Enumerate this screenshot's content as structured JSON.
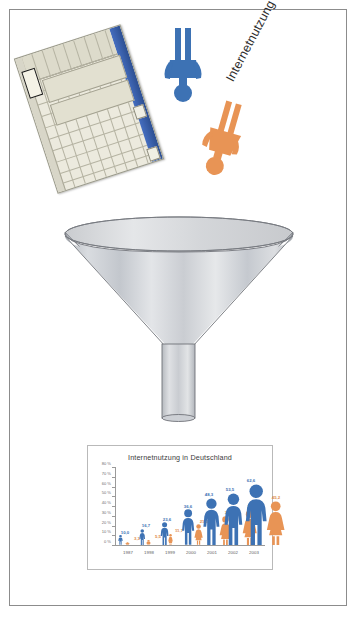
{
  "caption": "Internetnutzung",
  "icons": {
    "spreadsheet": "spreadsheet-window-icon",
    "male_figure": "male-pictogram-icon",
    "female_figure": "female-pictogram-icon",
    "funnel": "funnel-icon"
  },
  "colors": {
    "male_blue": "#3d72b4",
    "female_orange": "#e89455",
    "funnel_metal": "#c8cbd0",
    "frame_border": "#8c8c8c"
  },
  "chart_data": {
    "type": "bar",
    "title": "Internetnutzung in Deutschland",
    "xlabel": "",
    "ylabel": "",
    "ylim": [
      0,
      80
    ],
    "grid": false,
    "legend_position": "none",
    "categories": [
      "1987",
      "1998",
      "1999",
      "2000",
      "2001",
      "2002",
      "2003"
    ],
    "ytick_labels": [
      "0 %",
      "10 %",
      "20 %",
      "30 %",
      "40 %",
      "50 %",
      "60 %",
      "70 %",
      "80 %"
    ],
    "ytick_values": [
      0,
      10,
      20,
      30,
      40,
      50,
      60,
      70,
      80
    ],
    "series": [
      {
        "name": "Männer",
        "color": "#3d72b4",
        "values": [
          10.0,
          16.7,
          23.6,
          36.6,
          48.3,
          53.5,
          62.6
        ],
        "labels": [
          "10,0",
          "16,7",
          "23,6",
          "36,6",
          "48,3",
          "53,5",
          "62,6"
        ]
      },
      {
        "name": "Frauen",
        "color": "#e89455",
        "values": [
          3.3,
          5.5,
          11.7,
          21.3,
          30.1,
          36.0,
          45.2
        ],
        "labels": [
          "3,3",
          "5,5",
          "11,7",
          "21,3",
          "30,1",
          "36,0",
          "45,2"
        ]
      }
    ]
  }
}
